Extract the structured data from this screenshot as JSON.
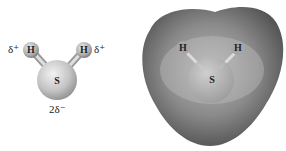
{
  "ball_stick": {
    "atoms": {
      "h_left": "H",
      "h_right": "H",
      "s": "S"
    },
    "charges": {
      "h_left": "δ⁺",
      "h_right": "δ⁺",
      "s": "2δ⁻"
    }
  },
  "electrostatic_map": {
    "atoms": {
      "h_left": "H",
      "h_right": "H",
      "s": "S"
    }
  }
}
